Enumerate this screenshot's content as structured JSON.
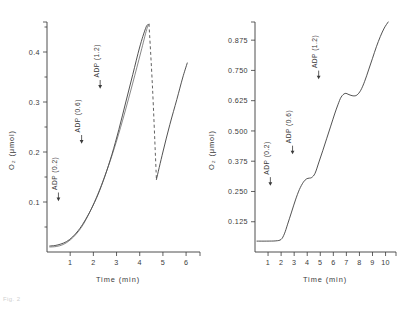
{
  "figure": {
    "caption": "Fig. 2"
  },
  "chart_data": [
    {
      "type": "line",
      "panel": "left",
      "title": "",
      "xlabel": "Time (min)",
      "ylabel": "O₂ (μmol)",
      "xlim": [
        0,
        6.6
      ],
      "ylim": [
        0,
        0.46
      ],
      "xticks": [
        "1",
        "2",
        "3",
        "4",
        "5",
        "6"
      ],
      "xtick_values": [
        1,
        2,
        3,
        4,
        5,
        6
      ],
      "yticks": [
        "0.1",
        "0.2",
        "0.3",
        "0.4"
      ],
      "ytick_values": [
        0.1,
        0.2,
        0.3,
        0.4
      ],
      "minor_yticks": [
        0.05,
        0.15,
        0.25,
        0.35,
        0.45
      ],
      "grid": false,
      "legend": "none",
      "annotations": [
        {
          "label": "ADP (0.2)",
          "x": 1.55,
          "y": 0.1
        },
        {
          "label": "ADP (0.6)",
          "x": 2.55,
          "y": 0.215
        },
        {
          "label": "ADP (1.2)",
          "x": 3.35,
          "y": 0.325
        }
      ],
      "series": [
        {
          "name": "trace-1",
          "style": "solid",
          "x": [
            0.12,
            0.35,
            0.6,
            0.85,
            1.1,
            1.35,
            1.6,
            1.9,
            2.2,
            2.5,
            2.8,
            3.1,
            3.4,
            3.7,
            4.0,
            4.25,
            4.35
          ],
          "y": [
            0.012,
            0.013,
            0.016,
            0.021,
            0.03,
            0.043,
            0.06,
            0.085,
            0.115,
            0.152,
            0.195,
            0.245,
            0.3,
            0.355,
            0.41,
            0.447,
            0.455
          ]
        },
        {
          "name": "trace-2",
          "style": "solid",
          "x": [
            0.12,
            0.4,
            0.7,
            1.0,
            1.3,
            1.6,
            1.95,
            2.3,
            2.65,
            3.0,
            3.35,
            3.7,
            4.05,
            4.3,
            4.4
          ],
          "y": [
            0.01,
            0.011,
            0.015,
            0.024,
            0.038,
            0.058,
            0.09,
            0.128,
            0.172,
            0.222,
            0.278,
            0.338,
            0.4,
            0.445,
            0.456
          ]
        },
        {
          "name": "dashed-drop",
          "style": "dashed",
          "x": [
            4.4,
            4.55,
            4.68,
            4.72
          ],
          "y": [
            0.456,
            0.33,
            0.19,
            0.145
          ]
        },
        {
          "name": "trace-3",
          "style": "solid",
          "x": [
            4.72,
            5.0,
            5.3,
            5.6,
            5.85,
            6.05
          ],
          "y": [
            0.145,
            0.2,
            0.255,
            0.305,
            0.348,
            0.378
          ]
        }
      ]
    },
    {
      "type": "line",
      "panel": "right",
      "title": "",
      "xlabel": "Time (min)",
      "ylabel": "O₂ (μmol)",
      "xlim": [
        0,
        10.8
      ],
      "ylim": [
        0,
        0.95
      ],
      "xticks": [
        "1",
        "2",
        "3",
        "4",
        "5",
        "6",
        "7",
        "8",
        "9",
        "10"
      ],
      "xtick_values": [
        1,
        2,
        3,
        4,
        5,
        6,
        7,
        8,
        9,
        10
      ],
      "yticks": [
        "0.125",
        "0.250",
        "0.375",
        "0.500",
        "0.625",
        "0.750",
        "0.875"
      ],
      "ytick_values": [
        0.125,
        0.25,
        0.375,
        0.5,
        0.625,
        0.75,
        0.875
      ],
      "grid": false,
      "legend": "none",
      "annotations": [
        {
          "label": "ADP (0.2)",
          "x": 2.9,
          "y": 0.27
        },
        {
          "label": "ADP (0.6)",
          "x": 4.6,
          "y": 0.4
        },
        {
          "label": "ADP (1.2)",
          "x": 6.6,
          "y": 0.71
        }
      ],
      "series": [
        {
          "name": "oxygraph-trace",
          "style": "solid",
          "x": [
            0.15,
            0.9,
            1.6,
            2.0,
            2.25,
            2.5,
            2.8,
            3.1,
            3.4,
            3.7,
            3.95,
            4.15,
            4.35,
            4.6,
            4.9,
            5.2,
            5.5,
            5.8,
            6.1,
            6.35,
            6.6,
            6.9,
            7.2,
            7.5,
            7.8,
            8.1,
            8.4,
            8.7,
            9.0,
            9.3,
            9.6,
            9.9,
            10.2
          ],
          "y": [
            0.045,
            0.045,
            0.046,
            0.052,
            0.075,
            0.115,
            0.165,
            0.215,
            0.258,
            0.288,
            0.302,
            0.305,
            0.308,
            0.325,
            0.372,
            0.42,
            0.47,
            0.52,
            0.57,
            0.608,
            0.64,
            0.655,
            0.65,
            0.645,
            0.648,
            0.668,
            0.705,
            0.752,
            0.8,
            0.848,
            0.89,
            0.925,
            0.95
          ]
        }
      ]
    }
  ]
}
